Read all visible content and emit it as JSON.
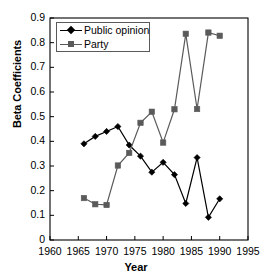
{
  "chart_data": {
    "type": "line",
    "title": "",
    "xlabel": "Year",
    "ylabel": "Beta Coefficients",
    "xlim": [
      1960,
      1995
    ],
    "ylim": [
      0,
      0.9
    ],
    "xticks": [
      "1960",
      "1965",
      "1970",
      "1975",
      "1980",
      "1985",
      "1990",
      "1995"
    ],
    "yticks": [
      "0",
      "0.1",
      "0.2",
      "0.3",
      "0.4",
      "0.5",
      "0.6",
      "0.7",
      "0.8",
      "0.9"
    ],
    "xtick_values": [
      1960,
      1965,
      1970,
      1975,
      1980,
      1985,
      1990,
      1995
    ],
    "ytick_values": [
      0,
      0.1,
      0.2,
      0.3,
      0.4,
      0.5,
      0.6,
      0.7,
      0.8,
      0.9
    ],
    "grid": false,
    "legend_position": "top-left",
    "series": [
      {
        "name": "Public opinion",
        "color": "#000000",
        "marker": "diamond",
        "x": [
          1966,
          1968,
          1970,
          1972,
          1974,
          1976,
          1978,
          1980,
          1982,
          1984,
          1986,
          1988,
          1990
        ],
        "values": [
          0.39,
          0.42,
          0.44,
          0.46,
          0.385,
          0.34,
          0.275,
          0.315,
          0.265,
          0.148,
          0.334,
          0.092,
          0.167
        ]
      },
      {
        "name": "Party",
        "color": "#5a5a5a",
        "marker": "square",
        "x": [
          1966,
          1968,
          1970,
          1972,
          1974,
          1976,
          1978,
          1980,
          1982,
          1984,
          1986,
          1988,
          1990
        ],
        "values": [
          0.17,
          0.145,
          0.142,
          0.302,
          0.353,
          0.475,
          0.52,
          0.395,
          0.53,
          0.836,
          0.531,
          0.841,
          0.828
        ]
      }
    ]
  },
  "axes": {
    "xlabel": "Year",
    "ylabel": "Beta Coefficients"
  }
}
